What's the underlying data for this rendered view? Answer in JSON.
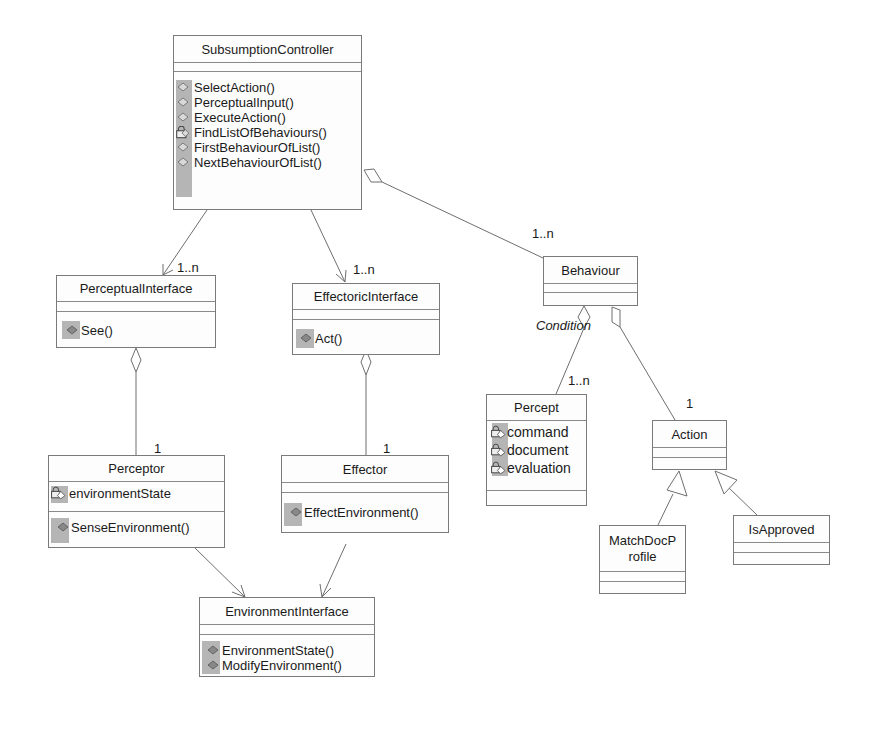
{
  "diagram": {
    "type": "UML class diagram",
    "classes": {
      "subsumption_controller": {
        "name": "SubsumptionController",
        "attributes": [],
        "operations": [
          {
            "name": "SelectAction()",
            "icon": "public-method-icon"
          },
          {
            "name": "PerceptualInput()",
            "icon": "public-method-icon"
          },
          {
            "name": "ExecuteAction()",
            "icon": "public-method-icon"
          },
          {
            "name": "FindListOfBehaviours()",
            "icon": "private-method-icon"
          },
          {
            "name": "FirstBehaviourOfList()",
            "icon": "public-method-icon"
          },
          {
            "name": "NextBehaviourOfList()",
            "icon": "public-method-icon"
          }
        ]
      },
      "perceptual_interface": {
        "name": "PerceptualInterface",
        "attributes": [],
        "operations": [
          {
            "name": "See()",
            "icon": "public-method-icon"
          }
        ]
      },
      "effectoric_interface": {
        "name": "EffectoricInterface",
        "attributes": [],
        "operations": [
          {
            "name": "Act()",
            "icon": "public-method-icon"
          }
        ]
      },
      "behaviour": {
        "name": "Behaviour",
        "attributes": [],
        "operations": []
      },
      "perceptor": {
        "name": "Perceptor",
        "attributes": [
          {
            "name": "environmentState",
            "icon": "private-attribute-icon"
          }
        ],
        "operations": [
          {
            "name": "SenseEnvironment()",
            "icon": "public-method-icon"
          }
        ]
      },
      "effector": {
        "name": "Effector",
        "attributes": [],
        "operations": [
          {
            "name": "EffectEnvironment()",
            "icon": "public-method-icon"
          }
        ]
      },
      "percept": {
        "name": "Percept",
        "attributes": [
          {
            "name": "command",
            "icon": "private-attribute-icon"
          },
          {
            "name": "document",
            "icon": "private-attribute-icon"
          },
          {
            "name": "evaluation",
            "icon": "private-attribute-icon"
          }
        ],
        "operations": []
      },
      "action": {
        "name": "Action",
        "attributes": [],
        "operations": []
      },
      "match_doc_profile": {
        "name_line1": "MatchDocP",
        "name_line2": "rofile",
        "attributes": [],
        "operations": []
      },
      "is_approved": {
        "name": "IsApproved",
        "attributes": [],
        "operations": []
      },
      "environment_interface": {
        "name": "EnvironmentInterface",
        "attributes": [],
        "operations": [
          {
            "name": "EnvironmentState()",
            "icon": "public-method-icon"
          },
          {
            "name": "ModifyEnvironment()",
            "icon": "public-method-icon"
          }
        ]
      }
    },
    "relationships": [
      {
        "from": "SubsumptionController",
        "to": "PerceptualInterface",
        "kind": "association",
        "multiplicity": "1..n"
      },
      {
        "from": "SubsumptionController",
        "to": "EffectoricInterface",
        "kind": "association",
        "multiplicity": "1..n"
      },
      {
        "from": "SubsumptionController",
        "to": "Behaviour",
        "kind": "aggregation",
        "multiplicity": "1..n"
      },
      {
        "from": "PerceptualInterface",
        "to": "Perceptor",
        "kind": "aggregation",
        "multiplicity": "1"
      },
      {
        "from": "EffectoricInterface",
        "to": "Effector",
        "kind": "aggregation",
        "multiplicity": "1"
      },
      {
        "from": "Behaviour",
        "to": "Percept",
        "kind": "aggregation",
        "role": "Condition",
        "multiplicity": "1..n"
      },
      {
        "from": "Behaviour",
        "to": "Action",
        "kind": "aggregation",
        "multiplicity": "1"
      },
      {
        "from": "MatchDocProfile",
        "to": "Action",
        "kind": "generalization"
      },
      {
        "from": "IsApproved",
        "to": "Action",
        "kind": "generalization"
      },
      {
        "from": "Perceptor",
        "to": "EnvironmentInterface",
        "kind": "association"
      },
      {
        "from": "Effector",
        "to": "EnvironmentInterface",
        "kind": "association"
      }
    ],
    "labels": {
      "mult_perceptual": "1..n",
      "mult_effectoric": "1..n",
      "mult_behaviour": "1..n",
      "mult_perceptor": "1",
      "mult_effector": "1",
      "mult_percept": "1..n",
      "mult_action": "1",
      "role_condition": "Condition"
    },
    "colors": {
      "line": "#6e6e6e",
      "border": "#7a7a7a",
      "gutter": "#b5b5b5",
      "text": "#1a1a1a"
    }
  }
}
